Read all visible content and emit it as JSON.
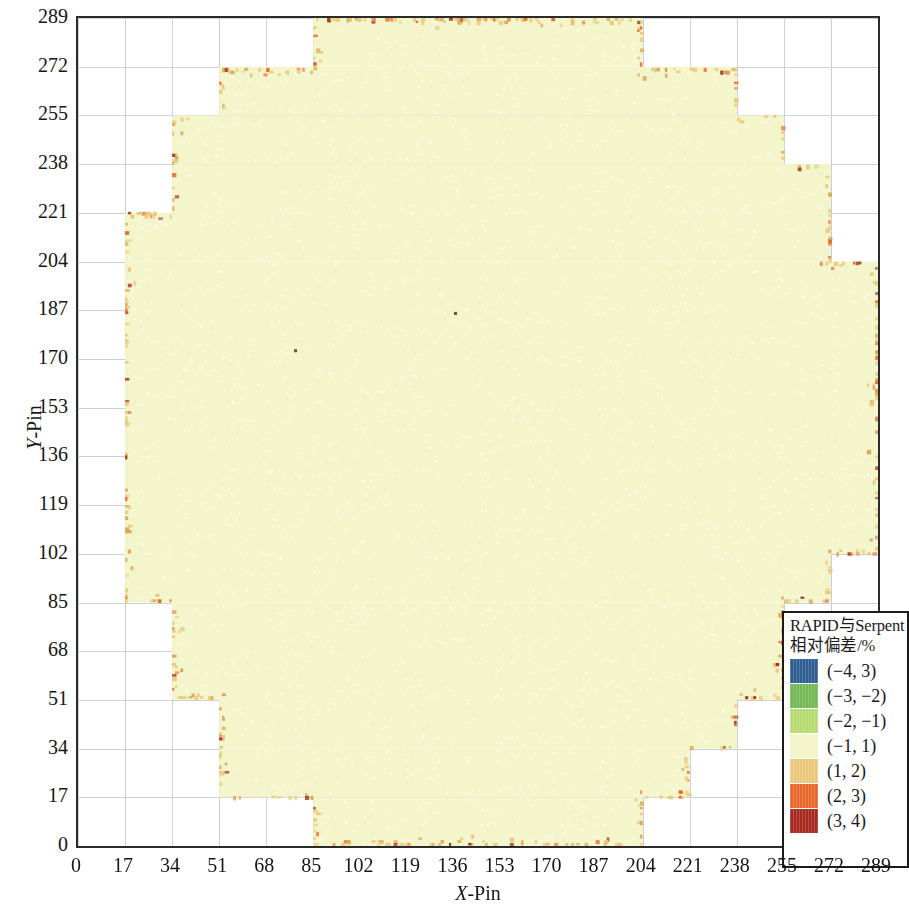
{
  "figure": {
    "x_axis": {
      "label_italic": "X",
      "label_rest": "-Pin",
      "ticks": [
        0,
        17,
        34,
        51,
        68,
        85,
        102,
        119,
        136,
        153,
        170,
        187,
        204,
        221,
        238,
        255,
        272,
        289
      ],
      "min": 0,
      "max": 289
    },
    "y_axis": {
      "label_italic": "Y",
      "label_rest": "-Pin",
      "ticks": [
        0,
        17,
        34,
        51,
        68,
        85,
        102,
        119,
        136,
        153,
        170,
        187,
        204,
        221,
        238,
        255,
        272,
        289
      ],
      "min": 0,
      "max": 289
    }
  },
  "legend": {
    "title_line1": "RAPID与Serpent",
    "title_line2": "相对偏差/%",
    "entries": [
      {
        "label": "(−4, 3)",
        "color": "#2f5f92"
      },
      {
        "label": "(−3, −2)",
        "color": "#74b857"
      },
      {
        "label": "(−2, −1)",
        "color": "#b7da6f"
      },
      {
        "label": "(−1, 1)",
        "color": "#f3f5c9"
      },
      {
        "label": "(1, 2)",
        "color": "#e9c87b"
      },
      {
        "label": "(2, 3)",
        "color": "#e8672d"
      },
      {
        "label": "(3, 4)",
        "color": "#a62a1f"
      }
    ]
  },
  "chart_data": {
    "type": "heatmap",
    "title": "",
    "xlabel": "X-Pin",
    "ylabel": "Y-Pin",
    "xlim": [
      0,
      289
    ],
    "ylim": [
      0,
      289
    ],
    "grid": true,
    "legend_position": "inside-bottom-right",
    "legend_title": "RAPID与Serpent 相对偏差/%",
    "colorbar_bins": [
      {
        "range": [
          -4,
          -3
        ],
        "label": "(−4, 3)",
        "color": "#2f5f92"
      },
      {
        "range": [
          -3,
          -2
        ],
        "label": "(−3, −2)",
        "color": "#74b857"
      },
      {
        "range": [
          -2,
          -1
        ],
        "label": "(−2, −1)",
        "color": "#b7da6f"
      },
      {
        "range": [
          -1,
          1
        ],
        "label": "(−1, 1)",
        "color": "#f3f5c9"
      },
      {
        "range": [
          1,
          2
        ],
        "label": "(1, 2)",
        "color": "#e9c87b"
      },
      {
        "range": [
          2,
          3
        ],
        "label": "(2, 3)",
        "color": "#e8672d"
      },
      {
        "range": [
          3,
          4
        ],
        "label": "(3, 4)",
        "color": "#a62a1f"
      }
    ],
    "dominant_value_bin": "(−1, 1)",
    "core_shape": "stair-stepped circular reactor core",
    "core_rows_extent": [
      {
        "y_from": 0,
        "y_to": 17,
        "x_from": 85,
        "x_to": 204
      },
      {
        "y_from": 17,
        "y_to": 34,
        "x_from": 51,
        "x_to": 221
      },
      {
        "y_from": 34,
        "y_to": 51,
        "x_from": 51,
        "x_to": 238
      },
      {
        "y_from": 51,
        "y_to": 85,
        "x_from": 34,
        "x_to": 255
      },
      {
        "y_from": 85,
        "y_to": 102,
        "x_from": 17,
        "x_to": 272
      },
      {
        "y_from": 102,
        "y_to": 204,
        "x_from": 17,
        "x_to": 289
      },
      {
        "y_from": 204,
        "y_to": 221,
        "x_from": 17,
        "x_to": 272
      },
      {
        "y_from": 221,
        "y_to": 238,
        "x_from": 34,
        "x_to": 272
      },
      {
        "y_from": 238,
        "y_to": 255,
        "x_from": 34,
        "x_to": 255
      },
      {
        "y_from": 255,
        "y_to": 272,
        "x_from": 51,
        "x_to": 238
      },
      {
        "y_from": 272,
        "y_to": 289,
        "x_from": 85,
        "x_to": 204
      }
    ]
  }
}
